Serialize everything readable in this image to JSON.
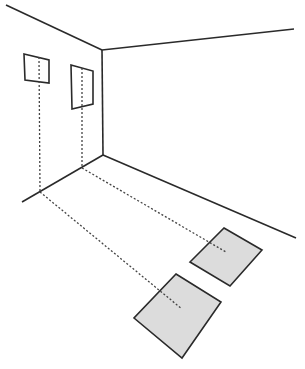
{
  "diagram": {
    "colors": {
      "line": "#2a2a2a",
      "dotted": "#444444",
      "patch_fill": "#dcdcdc",
      "background": "#ffffff"
    },
    "room": {
      "corner_top": [
        102,
        50
      ],
      "corner_bottom": [
        103,
        155
      ],
      "ceiling_left_end": [
        6,
        5
      ],
      "ceiling_right_end": [
        294,
        29
      ],
      "floor_left_end": [
        22,
        202
      ],
      "floor_right_end": [
        296,
        238
      ]
    },
    "windows": [
      {
        "id": "window-left",
        "corners": [
          [
            24,
            54
          ],
          [
            49,
            60
          ],
          [
            49,
            83
          ],
          [
            25,
            80
          ]
        ],
        "drop_top": [
          39,
          57
        ],
        "drop_floor": [
          40,
          192
        ],
        "patch_center": [
          182,
          309
        ]
      },
      {
        "id": "window-right",
        "corners": [
          [
            71,
            65
          ],
          [
            93,
            71
          ],
          [
            93,
            104
          ],
          [
            72,
            109
          ]
        ],
        "drop_top": [
          82,
          68
        ],
        "drop_floor": [
          82,
          168
        ],
        "patch_center": [
          226,
          252
        ]
      }
    ],
    "light_patches": [
      {
        "id": "patch-near",
        "corners": [
          [
            224,
            228
          ],
          [
            262,
            250
          ],
          [
            230,
            286
          ],
          [
            190,
            262
          ]
        ]
      },
      {
        "id": "patch-far",
        "corners": [
          [
            176,
            274
          ],
          [
            221,
            302
          ],
          [
            182,
            358
          ],
          [
            134,
            318
          ]
        ]
      }
    ]
  }
}
